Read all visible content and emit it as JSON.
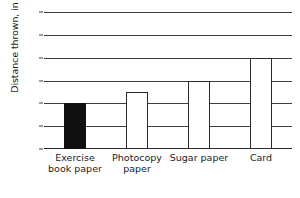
{
  "chart_data": {
    "type": "bar",
    "title": "",
    "xlabel": "",
    "ylabel": "Distance thrown, in m",
    "categories": [
      "Exercise book paper",
      "Photocopy paper",
      "Sugar paper",
      "Card"
    ],
    "values": [
      2,
      2.5,
      3,
      4
    ],
    "bar_styles": [
      "filled",
      "open",
      "open",
      "open"
    ],
    "ylim": [
      0,
      6
    ],
    "ytick_labels": [
      "0",
      "1",
      "2",
      "3",
      "4",
      "5",
      "6"
    ],
    "ytick_values": [
      0,
      1,
      2,
      3,
      4,
      5,
      6
    ],
    "grid": true,
    "legend": "none",
    "colors": {
      "filled_bar": "#101010",
      "open_bar": "#ffffff",
      "bar_outline": "#2a2a2a",
      "gridline": "#3d3d3d",
      "text": "#1a1a1a",
      "background": "#ffffff"
    }
  },
  "footer": {
    "fragment": ""
  }
}
